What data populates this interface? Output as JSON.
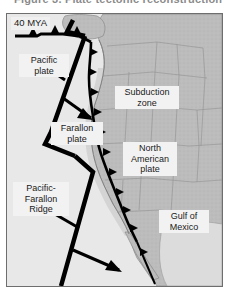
{
  "figure": {
    "caption_partial": "Figure 3.  Plate tectonic reconstruction"
  },
  "map": {
    "age_label": "40 MYA",
    "frame_color": "#6e6e6e",
    "ocean_color": "#e6e6e6",
    "land_color": "#b9b9b9",
    "label_box_color": "#f2f2f2",
    "line_color": "#000000",
    "labels": {
      "pacific_plate": "Pacific\nplate",
      "farallon_plate": "Farallon\nplate",
      "pacific_farallon_ridge": "Pacific-\nFarallon\nRidge",
      "subduction_zone": "Subduction\nzone",
      "north_american_plate": "North\nAmerican\nplate",
      "gulf_of_mexico": "Gulf of\nMexico"
    },
    "features": {
      "ridge_name": "Pacific-Farallon Ridge",
      "trench_name": "Subduction zone trench",
      "arrow_count": 4,
      "arrow_directions": [
        "northwest",
        "southeast",
        "northwest",
        "southeast"
      ]
    }
  }
}
